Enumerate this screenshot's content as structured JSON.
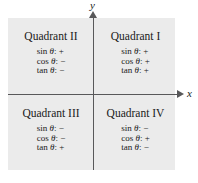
{
  "figure": {
    "axes": {
      "x_label": "x",
      "y_label": "y",
      "x_arrow_icon": "arrow-right-icon",
      "y_arrow_icon": "arrow-up-icon",
      "axis_color": "#58585a"
    },
    "plot_background": "#ebebeb",
    "quadrants": [
      {
        "id": "quadrant-1",
        "title": "Quadrant I",
        "ratios": [
          {
            "name": "sin",
            "symbol": "θ",
            "sign": "+"
          },
          {
            "name": "cos",
            "symbol": "θ",
            "sign": "+"
          },
          {
            "name": "tan",
            "symbol": "θ",
            "sign": "+"
          }
        ]
      },
      {
        "id": "quadrant-2",
        "title": "Quadrant II",
        "ratios": [
          {
            "name": "sin",
            "symbol": "θ",
            "sign": "+"
          },
          {
            "name": "cos",
            "symbol": "θ",
            "sign": "−"
          },
          {
            "name": "tan",
            "symbol": "θ",
            "sign": "−"
          }
        ]
      },
      {
        "id": "quadrant-3",
        "title": "Quadrant III",
        "ratios": [
          {
            "name": "sin",
            "symbol": "θ",
            "sign": "−"
          },
          {
            "name": "cos",
            "symbol": "θ",
            "sign": "−"
          },
          {
            "name": "tan",
            "symbol": "θ",
            "sign": "+"
          }
        ]
      },
      {
        "id": "quadrant-4",
        "title": "Quadrant IV",
        "ratios": [
          {
            "name": "sin",
            "symbol": "θ",
            "sign": "−"
          },
          {
            "name": "cos",
            "symbol": "θ",
            "sign": "+"
          },
          {
            "name": "tan",
            "symbol": "θ",
            "sign": "−"
          }
        ]
      }
    ]
  }
}
